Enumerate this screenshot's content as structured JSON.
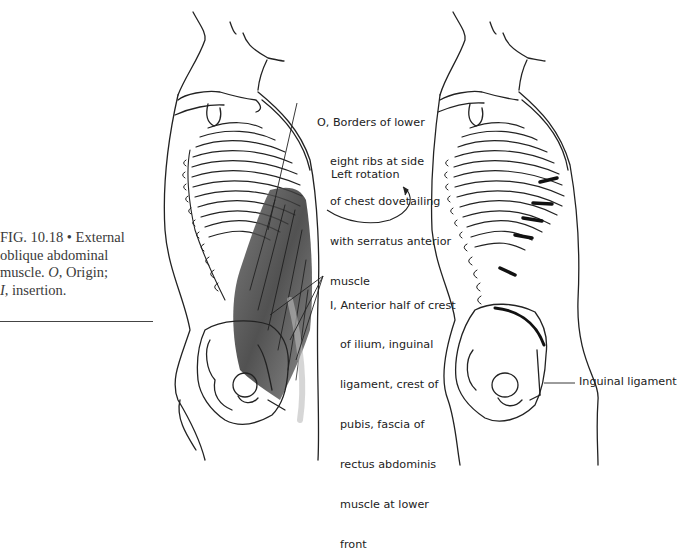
{
  "figure": {
    "caption": {
      "number": "FIG. 10.18",
      "bullet": "•",
      "line1": "FIG. 10.18 • External",
      "line2": "oblique abdominal",
      "line3_pre": "muscle. ",
      "line3_o": "O",
      "line3_post": ", Origin;",
      "line4_i": "I",
      "line4_post": ", insertion."
    },
    "left_illustration": {
      "description": "Lateral view of torso skeleton with external oblique abdominal muscle shaded",
      "origin_label": {
        "marker": "O,",
        "lines": [
          "O, Borders of lower",
          "eight ribs at side",
          "of chest dovetailing",
          "with serratus anterior",
          "muscle"
        ]
      },
      "insertion_label": {
        "marker": "I,",
        "lines": [
          "I, Anterior half of crest",
          "of ilium, inguinal",
          "ligament, crest of",
          "pubis, fascia of",
          "rectus abdominis",
          "muscle at lower",
          "front"
        ]
      }
    },
    "center_annotation": {
      "text": "Left rotation",
      "arrow": "curved-arrow"
    },
    "right_illustration": {
      "description": "Lateral view of torso skeleton showing rotation with inguinal ligament marked",
      "label": "Inguinal ligament"
    }
  },
  "colors": {
    "ink": "#222222",
    "caption_text": "#3a3a3a",
    "muscle_shade": "#555555",
    "background": "#ffffff"
  }
}
